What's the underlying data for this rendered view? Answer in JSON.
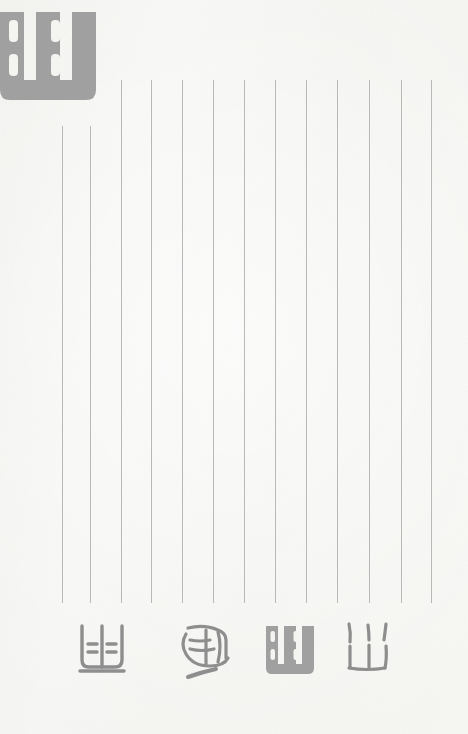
{
  "page": {
    "kind": "scanned-manuscript-page",
    "width": 468,
    "height": 734,
    "background_color": "#f6f6f4",
    "ink_color": "#8e8e8e",
    "rule_color": "#b9b9b9",
    "orientation": "vertical-columns",
    "title": "",
    "visible_text": ""
  },
  "ruling": {
    "name": "vertical-column-rules",
    "count": 13,
    "stroke_width_px": 1,
    "color": "#b9b9b9",
    "lines": [
      {
        "id": "rule-1",
        "x": 62,
        "y_top": 126,
        "y_bottom": 603
      },
      {
        "id": "rule-2",
        "x": 90,
        "y_top": 126,
        "y_bottom": 603
      },
      {
        "id": "rule-3",
        "x": 121,
        "y_top": 80,
        "y_bottom": 603
      },
      {
        "id": "rule-4",
        "x": 151,
        "y_top": 80,
        "y_bottom": 603
      },
      {
        "id": "rule-5",
        "x": 182,
        "y_top": 80,
        "y_bottom": 603
      },
      {
        "id": "rule-6",
        "x": 213,
        "y_top": 80,
        "y_bottom": 603
      },
      {
        "id": "rule-7",
        "x": 244,
        "y_top": 80,
        "y_bottom": 603
      },
      {
        "id": "rule-8",
        "x": 275,
        "y_top": 80,
        "y_bottom": 603
      },
      {
        "id": "rule-9",
        "x": 306,
        "y_top": 80,
        "y_bottom": 603
      },
      {
        "id": "rule-10",
        "x": 337,
        "y_top": 80,
        "y_bottom": 603
      },
      {
        "id": "rule-11",
        "x": 369,
        "y_top": 80,
        "y_bottom": 603
      },
      {
        "id": "rule-12",
        "x": 401,
        "y_top": 80,
        "y_bottom": 603
      },
      {
        "id": "rule-13",
        "x": 431,
        "y_top": 80,
        "y_bottom": 603
      }
    ]
  },
  "masthead_glyph": {
    "name": "large-glyph-top-left",
    "description": "oversized gray brush glyph, clipped by the left page edge",
    "shape": "square-u-with-four-inner-tick-marks",
    "x": -8,
    "y": 6,
    "width": 112,
    "height": 96,
    "color": "#a0a0a0"
  },
  "glyph_row": {
    "name": "bottom-glyph-row",
    "baseline_y": 685,
    "count": 4,
    "glyphs": [
      {
        "id": "glyph-1",
        "shape": "u-frame-with-center-post-and-four-dashes",
        "description": "open-topped frame, vertical center post, two pairs of short horizontal dashes, long flat base stroke",
        "x": 76,
        "y": 622,
        "width": 52,
        "height": 64
      },
      {
        "id": "glyph-2",
        "shape": "tilted-rounded-box-with-cross-strokes",
        "description": "rounded leaning box with interior lattice strokes and a detached slanted stroke beneath",
        "x": 176,
        "y": 622,
        "width": 56,
        "height": 64
      },
      {
        "id": "glyph-3",
        "shape": "square-u-with-four-inner-tick-marks",
        "description": "filled square U frame with two columns each holding two tick marks; same sign as the masthead glyph",
        "x": 262,
        "y": 622,
        "width": 56,
        "height": 64
      },
      {
        "id": "glyph-4",
        "shape": "three-pronged-w-with-detached-ticks",
        "description": "W / mountain-like sign, three prongs rising from a base stroke with three detached tick marks above",
        "x": 342,
        "y": 620,
        "width": 54,
        "height": 66
      }
    ]
  }
}
